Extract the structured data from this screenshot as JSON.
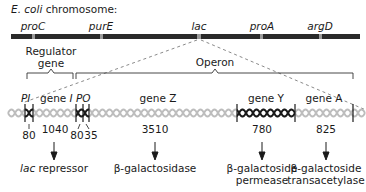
{
  "title": {
    "prefix": "E. coli",
    "suffix": " chromosome:"
  },
  "chromosome": {
    "color": "#2a2a2a",
    "markers": [
      {
        "label": "proC",
        "x": 33
      },
      {
        "label": "purE",
        "x": 101
      },
      {
        "label": "lac",
        "x": 198
      },
      {
        "label": "proA",
        "x": 262
      },
      {
        "label": "argD",
        "x": 320
      }
    ]
  },
  "brackets": {
    "regulator": {
      "line1": "Regulator",
      "line2": "gene"
    },
    "operon": {
      "label": "Operon"
    }
  },
  "segments": {
    "pi": "PI",
    "gene_i_prefix": "gene ",
    "gene_i_suffix": "I",
    "po": "PO",
    "gene_z": "gene Z",
    "gene_y": "gene Y",
    "gene_a": "gene A"
  },
  "lengths": {
    "pi": "80",
    "gene_i": "1040",
    "p": "80",
    "o": "35",
    "gene_z": "3510",
    "gene_y": "780",
    "gene_a": "825"
  },
  "products": {
    "repressor_prefix": "lac",
    "repressor_suffix": " repressor",
    "z": "β-galactosidase",
    "y_line1": "β-galactoside",
    "y_line2": "permease",
    "a_line1": "β-galactoside",
    "a_line2": "transacetylase"
  },
  "colors": {
    "helix_light": "#bdbdbd",
    "helix_dark": "#1a1a1a",
    "dashed": "#8a8a8a"
  }
}
